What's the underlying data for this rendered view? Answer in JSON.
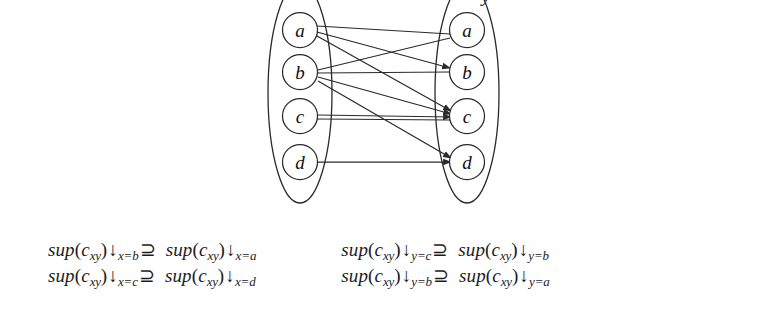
{
  "figure": {
    "type": "bipartite-graph-with-inequalities",
    "partial_glyph_top_right": "y",
    "left_group": {
      "name": "x-domain-ellipse",
      "nodes": [
        {
          "id": "L-a",
          "label": "a",
          "cx": 45,
          "cy": 44
        },
        {
          "id": "L-b",
          "label": "b",
          "cx": 45,
          "cy": 86
        },
        {
          "id": "L-c",
          "label": "c",
          "cx": 45,
          "cy": 130
        },
        {
          "id": "L-d",
          "label": "d",
          "cx": 45,
          "cy": 176
        }
      ]
    },
    "right_group": {
      "name": "y-domain-ellipse",
      "nodes": [
        {
          "id": "R-a",
          "label": "a",
          "cx": 212,
          "cy": 44
        },
        {
          "id": "R-b",
          "label": "b",
          "cx": 212,
          "cy": 86
        },
        {
          "id": "R-c",
          "label": "c",
          "cx": 212,
          "cy": 130
        },
        {
          "id": "R-d",
          "label": "d",
          "cx": 212,
          "cy": 176
        }
      ]
    },
    "edges": [
      {
        "name": "edge-Ra-to-La",
        "from": "R-a",
        "to": "L-a",
        "arrow": "left"
      },
      {
        "name": "edge-La-to-Rb",
        "from": "L-a",
        "to": "R-b",
        "arrow": "right"
      },
      {
        "name": "edge-La-to-Rc",
        "from": "L-a",
        "to": "R-c",
        "arrow": "right"
      },
      {
        "name": "edge-Ra-to-Lb",
        "from": "R-a",
        "to": "L-b",
        "arrow": "left"
      },
      {
        "name": "edge-Rb-to-Lb",
        "from": "R-b",
        "to": "L-b",
        "arrow": "left"
      },
      {
        "name": "edge-Lb-to-Rc",
        "from": "L-b",
        "to": "R-c",
        "arrow": "right"
      },
      {
        "name": "edge-Lb-to-Rd",
        "from": "L-b",
        "to": "R-d",
        "arrow": "right"
      },
      {
        "name": "edge-Lc-to-Rc",
        "from": "L-c",
        "to": "R-c",
        "arrow": "right"
      },
      {
        "name": "edge-Rc-to-Lc",
        "from": "R-c",
        "to": "L-c",
        "arrow": "left"
      },
      {
        "name": "edge-Ld-to-Rd",
        "from": "L-d",
        "to": "R-d",
        "arrow": "right"
      }
    ]
  },
  "formulas": {
    "x_column": [
      {
        "name": "inequality-x-b-supseteq-x-a",
        "lhs": {
          "fn": "sup",
          "open": "(",
          "var": "c",
          "sub": "xy",
          "close": ")",
          "restrict": "↓",
          "restrict_sub": "x=b"
        },
        "op": "⊇",
        "rhs": {
          "fn": "sup",
          "open": "(",
          "var": "c",
          "sub": "xy",
          "close": ")",
          "restrict": "↓",
          "restrict_sub": "x=a"
        }
      },
      {
        "name": "inequality-x-c-supseteq-x-d",
        "lhs": {
          "fn": "sup",
          "open": "(",
          "var": "c",
          "sub": "xy",
          "close": ")",
          "restrict": "↓",
          "restrict_sub": "x=c"
        },
        "op": "⊇",
        "rhs": {
          "fn": "sup",
          "open": "(",
          "var": "c",
          "sub": "xy",
          "close": ")",
          "restrict": "↓",
          "restrict_sub": "x=d"
        }
      }
    ],
    "y_column": [
      {
        "name": "inequality-y-c-supseteq-y-b",
        "lhs": {
          "fn": "sup",
          "open": "(",
          "var": "c",
          "sub": "xy",
          "close": ")",
          "restrict": "↓",
          "restrict_sub": "y=c"
        },
        "op": "⊇",
        "rhs": {
          "fn": "sup",
          "open": "(",
          "var": "c",
          "sub": "xy",
          "close": ")",
          "restrict": "↓",
          "restrict_sub": "y=b"
        }
      },
      {
        "name": "inequality-y-b-supseteq-y-a",
        "lhs": {
          "fn": "sup",
          "open": "(",
          "var": "c",
          "sub": "xy",
          "close": ")",
          "restrict": "↓",
          "restrict_sub": "y=b"
        },
        "op": "⊇",
        "rhs": {
          "fn": "sup",
          "open": "(",
          "var": "c",
          "sub": "xy",
          "close": ")",
          "restrict": "↓",
          "restrict_sub": "y=a"
        }
      }
    ]
  },
  "colors": {
    "background": "#ffffff",
    "ink": "#1a1a1a",
    "stroke": "#2a2a2a"
  }
}
